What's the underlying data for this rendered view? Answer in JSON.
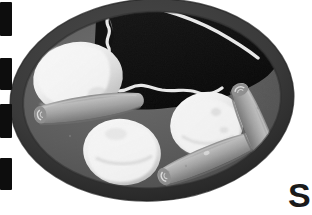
{
  "image": {
    "kind": "photograph",
    "subject": "plate-of-food",
    "color_mode": "grayscale",
    "width": 312,
    "height": 215,
    "alt": "Black and white photo of an oval plate holding a dark food item drizzled with white sauce, three pale rounded portions and three tapered rolled cylinders"
  },
  "palette": {
    "background": "#ffffff",
    "plate_rim": "#3a3a3a",
    "plate_rim_dark": "#2b2b2b",
    "plate_surface": "#5e5e5e",
    "plate_surface_light": "#6b6b6b",
    "dark_item": "#121212",
    "dark_item_edge": "#1d1d1d",
    "sauce_drizzle": "#e8e8e8",
    "blob_light": "#f2f2f2",
    "blob_mid": "#dcdcdc",
    "blob_shadow": "#c2c2c2",
    "roll_light": "#b9b9b9",
    "roll_mid": "#9a9a9a",
    "roll_dark": "#7c7c7c",
    "roll_tip": "#8a8a8a",
    "edge_mark": "#0d0d0d",
    "watermark": "#1a1a1a"
  },
  "plate": {
    "label": "oval plate",
    "center_x": 152,
    "center_y": 100,
    "radius_x": 142,
    "radius_y": 101,
    "rim_thickness": 13,
    "rotation_deg": -3
  },
  "elements": {
    "dark_item": {
      "label": "dark food item",
      "drizzle_label": "white sauce drizzle"
    },
    "blobs": [
      {
        "label": "pale portion upper left",
        "cx": 78,
        "cy": 78,
        "rx": 44,
        "ry": 35,
        "rot": -8
      },
      {
        "label": "pale portion lower center",
        "cx": 122,
        "cy": 152,
        "rx": 38,
        "ry": 32,
        "rot": 10
      },
      {
        "label": "pale portion right",
        "cx": 207,
        "cy": 124,
        "rx": 36,
        "ry": 31,
        "rot": -12
      }
    ],
    "rolls": [
      {
        "label": "rolled cylinder upper left",
        "x": 38,
        "y": 98,
        "length": 104,
        "thickness": 20,
        "rot": -8
      },
      {
        "label": "rolled cylinder lower center",
        "x": 158,
        "y": 148,
        "length": 102,
        "thickness": 19,
        "rot": -22
      },
      {
        "label": "rolled cylinder right",
        "x": 233,
        "y": 92,
        "length": 92,
        "thickness": 20,
        "rot": 68
      }
    ]
  },
  "edge_marks": {
    "label": "dashed edge marks",
    "count": 4,
    "items": [
      {
        "top": 2,
        "height": 34
      },
      {
        "top": 58,
        "height": 32
      },
      {
        "top": 104,
        "height": 34
      },
      {
        "top": 158,
        "height": 32
      }
    ]
  },
  "watermark": {
    "text": "S",
    "font_size": 34,
    "x": 288,
    "y": 178
  }
}
